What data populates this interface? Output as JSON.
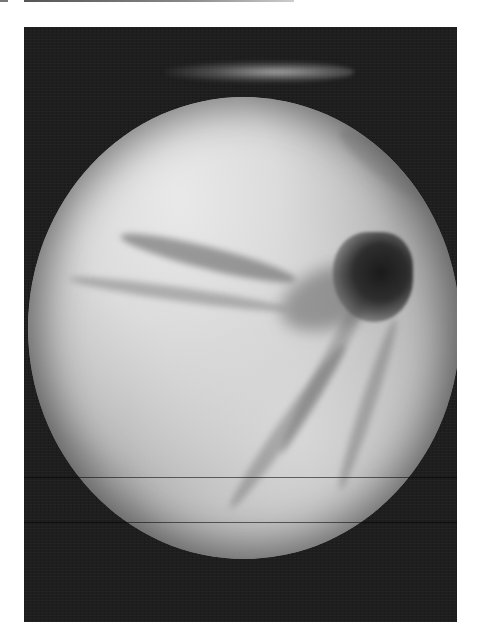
{
  "image": {
    "description": "Grayscale endoscopic view: bright circular field of view with mucosal folds converging toward a dark lumen at upper right, inside a dark rectangular frame",
    "colors": {
      "background": "#ffffff",
      "frame": "#1e1e1e",
      "tissue_light": "#e9e9e9",
      "tissue_mid": "#b5b5b5",
      "lumen": "#1a1a1a"
    },
    "frame_box": {
      "x": 24,
      "y": 27,
      "width": 433,
      "height": 595
    },
    "field_of_view": {
      "center_x": 242,
      "center_y": 330,
      "radius_x": 216,
      "radius_y": 231
    },
    "lumen_position": {
      "x": 370,
      "y": 205
    },
    "scanlines_y": [
      477,
      522
    ]
  }
}
